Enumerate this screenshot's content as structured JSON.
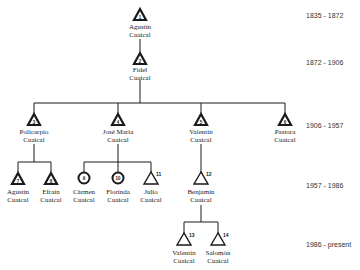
{
  "periods": [
    {
      "label": "1835 - 1872",
      "y": 12
    },
    {
      "label": "1872 - 1906",
      "y": 52
    },
    {
      "label": "1906 - 1957",
      "y": 123
    },
    {
      "label": "1957 - 1986",
      "y": 183
    },
    {
      "label": "1986 - present",
      "y": 244
    }
  ],
  "nodes": [
    {
      "id": 1,
      "first": "Agustín",
      "last": "Cuaical",
      "shape": "triangle-filled",
      "x": 140,
      "y": 8
    },
    {
      "id": 2,
      "first": "Fidel",
      "last": "Cuaical",
      "shape": "triangle-filled",
      "x": 140,
      "y": 52
    },
    {
      "id": 3,
      "first": "Policarpio",
      "last": "Cuaical",
      "shape": "triangle-filled",
      "x": 34,
      "y": 113
    },
    {
      "id": 4,
      "first": "José María",
      "last": "Cuaical",
      "shape": "triangle-filled",
      "x": 118,
      "y": 113
    },
    {
      "id": 5,
      "first": "Valentín",
      "last": "Cuaical",
      "shape": "triangle-filled",
      "x": 201,
      "y": 113
    },
    {
      "id": 6,
      "first": "Pastora",
      "last": "Cuaical",
      "shape": "triangle-filled",
      "x": 285,
      "y": 113
    },
    {
      "id": 7,
      "first": "Agustín",
      "last": "Cuaical",
      "shape": "triangle-filled",
      "x": 18,
      "y": 172
    },
    {
      "id": 8,
      "first": "Efraín",
      "last": "Cuaical",
      "shape": "triangle-filled",
      "x": 51,
      "y": 172
    },
    {
      "id": 9,
      "first": "Cármen",
      "last": "Cuaical",
      "shape": "circle",
      "x": 84,
      "y": 172
    },
    {
      "id": 10,
      "first": "Florinda",
      "last": "Cuaical",
      "shape": "circle",
      "x": 118,
      "y": 172
    },
    {
      "id": 11,
      "first": "Julio",
      "last": "Cuaical",
      "shape": "triangle-open",
      "x": 151,
      "y": 172
    },
    {
      "id": 12,
      "first": "Benjamín",
      "last": "Cuaical",
      "shape": "triangle-open",
      "x": 201,
      "y": 172
    },
    {
      "id": 13,
      "first": "Valentín",
      "last": "Cuaical",
      "shape": "triangle-open",
      "x": 184,
      "y": 233
    },
    {
      "id": 14,
      "first": "Salomón",
      "last": "Cuaical",
      "shape": "triangle-open",
      "x": 218,
      "y": 233
    }
  ],
  "labels": {
    "n1": {
      "first": "Agustín",
      "last": "Cuaical"
    },
    "n2": {
      "first": "Fidel",
      "last": "Cuaical"
    },
    "n3": {
      "first": "Policarpio",
      "last": "Cuaical"
    },
    "n4": {
      "first": "José María",
      "last": "Cuaical"
    },
    "n5": {
      "first": "Valentín",
      "last": "Cuaical"
    },
    "n6": {
      "first": "Pastora",
      "last": "Cuaical"
    },
    "n7": {
      "first": "Agustín",
      "last": "Cuaical"
    },
    "n8": {
      "first": "Efraín",
      "last": "Cuaical"
    },
    "n9": {
      "first": "Cármen",
      "last": "Cuaical"
    },
    "n10": {
      "first": "Florinda",
      "last": "Cuaical"
    },
    "n11": {
      "first": "Julio",
      "last": "Cuaical"
    },
    "n12": {
      "first": "Benjamín",
      "last": "Cuaical"
    },
    "n13": {
      "first": "Valentín",
      "last": "Cuaical"
    },
    "n14": {
      "first": "Salomón",
      "last": "Cuaical"
    }
  },
  "ids": {
    "n1": "1",
    "n2": "2",
    "n3": "3",
    "n4": "4",
    "n5": "5",
    "n6": "6",
    "n7": "7",
    "n8": "8",
    "n9": "9",
    "n10": "10",
    "n11": "11",
    "n12": "12",
    "n13": "13",
    "n14": "14"
  },
  "period_labels": {
    "p1": "1835 - 1872",
    "p2": "1872 - 1906",
    "p3": "1906 - 1957",
    "p4": "1957 - 1986",
    "p5": "1986 - present"
  },
  "colors": {
    "line": "#1a1a1a",
    "text": "#1a1a1a",
    "background": "#ffffff"
  }
}
